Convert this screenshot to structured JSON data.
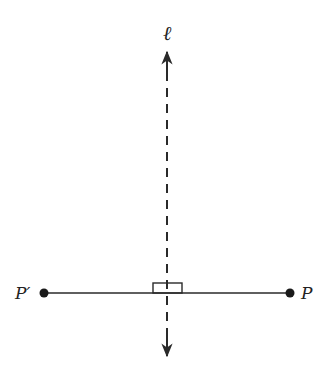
{
  "diagram": {
    "type": "geometry-reflection",
    "labels": {
      "line": "ℓ",
      "point_right": "P",
      "point_left": "P′"
    },
    "colors": {
      "stroke": "#2a2a2a",
      "background": "#ffffff"
    },
    "line_l": {
      "x": 167,
      "y_top": 50,
      "y_bottom": 356,
      "style": "dashed",
      "arrows": "both"
    },
    "segment": {
      "y": 293,
      "x_left": 44,
      "x_right": 290
    },
    "right_angle_marker": {
      "x": 153,
      "y": 283,
      "width": 29,
      "height": 10
    }
  }
}
